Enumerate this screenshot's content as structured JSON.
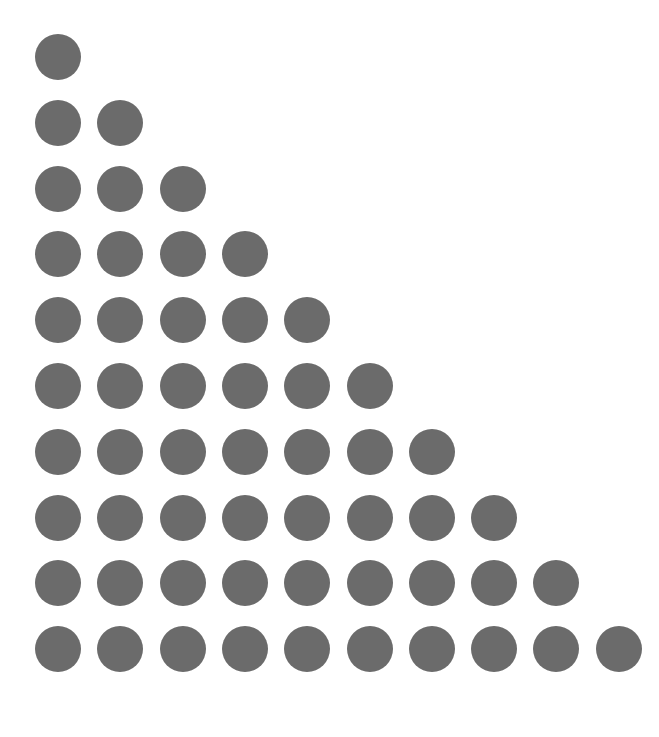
{
  "diagram": {
    "type": "triangular-dot-array",
    "rows": [
      1,
      2,
      3,
      4,
      5,
      6,
      7,
      8,
      9,
      10
    ],
    "total_dots": 55,
    "dot_color": "#6b6b6b",
    "background": "#ffffff"
  }
}
